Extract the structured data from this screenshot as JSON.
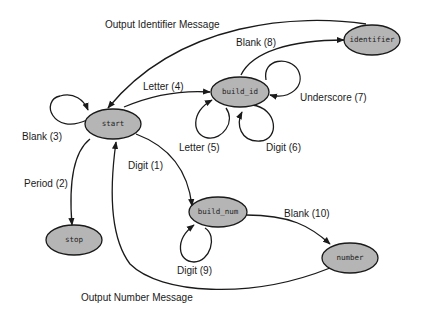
{
  "diagram": {
    "type": "state-machine",
    "nodes": {
      "start": "start",
      "build_id": "build_id",
      "identifier": "identifier",
      "stop": "stop",
      "build_num": "build_num",
      "number": "number"
    },
    "edges": {
      "output_identifier": "Output Identifier Message",
      "blank8": "Blank (8)",
      "letter4": "Letter (4)",
      "underscore7": "Underscore (7)",
      "blank3": "Blank (3)",
      "letter5": "Letter (5)",
      "digit6": "Digit (6)",
      "digit1": "Digit (1)",
      "period2": "Period (2)",
      "blank10": "Blank (10)",
      "digit9": "Digit (9)",
      "output_number": "Output Number Message"
    },
    "colors": {
      "node_fill": "#b5b5b5",
      "stroke": "#1a1a1a",
      "background": "#ffffff"
    }
  }
}
